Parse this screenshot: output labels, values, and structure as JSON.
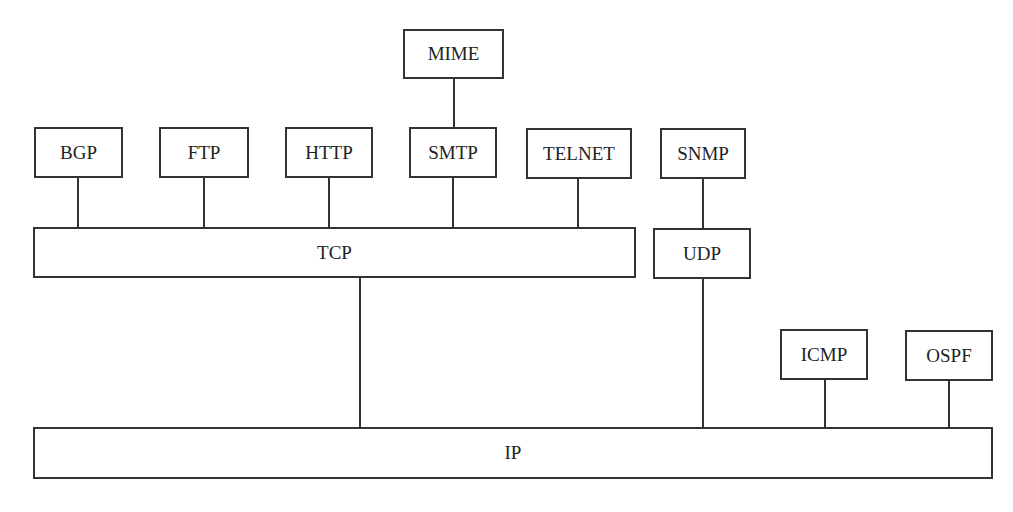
{
  "diagram": {
    "nodes": {
      "mime": "MIME",
      "bgp": "BGP",
      "ftp": "FTP",
      "http": "HTTP",
      "smtp": "SMTP",
      "telnet": "TELNET",
      "snmp": "SNMP",
      "tcp": "TCP",
      "udp": "UDP",
      "icmp": "ICMP",
      "ospf": "OSPF",
      "ip": "IP"
    },
    "edges": [
      [
        "MIME",
        "SMTP"
      ],
      [
        "BGP",
        "TCP"
      ],
      [
        "FTP",
        "TCP"
      ],
      [
        "HTTP",
        "TCP"
      ],
      [
        "SMTP",
        "TCP"
      ],
      [
        "TELNET",
        "TCP"
      ],
      [
        "SNMP",
        "UDP"
      ],
      [
        "TCP",
        "IP"
      ],
      [
        "UDP",
        "IP"
      ],
      [
        "ICMP",
        "IP"
      ],
      [
        "OSPF",
        "IP"
      ]
    ]
  }
}
